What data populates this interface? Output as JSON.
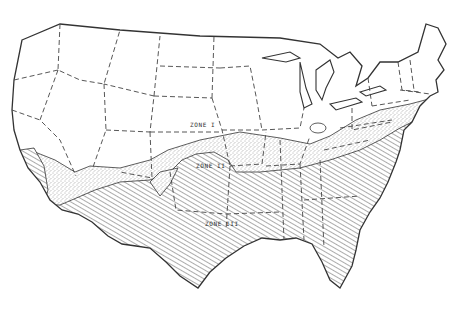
{
  "map": {
    "type": "climate-zone map",
    "region": "Contiguous United States",
    "style": "black and white line drawing",
    "zones": [
      {
        "id": "zone-1",
        "label": "ZONE I",
        "fill": "blank",
        "position": "north"
      },
      {
        "id": "zone-2",
        "label": "ZONE II",
        "fill": "stippled",
        "position": "middle band"
      },
      {
        "id": "zone-3",
        "label": "ZONE III",
        "fill": "diagonal hatching",
        "position": "south"
      }
    ],
    "borders": {
      "national": "solid line",
      "state": "dashed line"
    },
    "colors": {
      "ink": "#333333",
      "paper": "#ffffff"
    }
  },
  "caption": {
    "partial_text": " "
  }
}
